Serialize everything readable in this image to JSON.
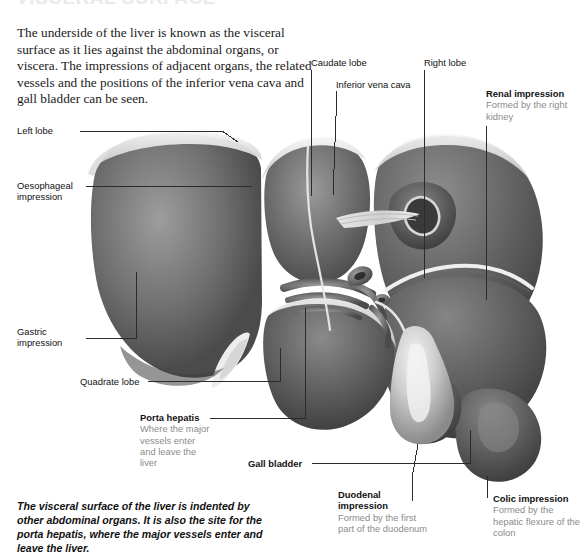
{
  "heading": {
    "clipped_title": "VISCERAL SURFACE"
  },
  "intro": {
    "text": "The underside of the liver is known as the visceral surface as it lies against the abdominal organs, or viscera. The impressions of adjacent organs, the related vessels and the positions of the inferior vena cava and gall bladder can be seen."
  },
  "caption": {
    "text": "The visceral surface of the liver is indented by other abdominal organs. It is also the site for the porta hepatis, where the major vessels enter and leave the liver."
  },
  "labels": {
    "left_lobe": {
      "title": "Left lobe"
    },
    "oesophageal_impression": {
      "line1": "Oesophageal",
      "line2": "impression"
    },
    "gastric_impression": {
      "line1": "Gastric",
      "line2": "impression"
    },
    "quadrate_lobe": {
      "title": "Quadrate lobe"
    },
    "porta_hepatis": {
      "title": "Porta hepatis",
      "sub": "Where the major vessels enter and leave the liver"
    },
    "gall_bladder": {
      "title": "Gall bladder"
    },
    "caudate_lobe": {
      "title": "Caudate lobe"
    },
    "inferior_vena_cava": {
      "title": "Inferior vena cava"
    },
    "right_lobe": {
      "title": "Right lobe"
    },
    "renal_impression": {
      "title": "Renal impression",
      "sub": "Formed by the right kidney"
    },
    "duodenal_impression": {
      "line1": "Duodenal",
      "line2": "impression",
      "sub": "Formed by the first part of the duodenum"
    },
    "colic_impression": {
      "title": "Colic impression",
      "sub": "Formed by the hepatic flexure of the colon"
    }
  },
  "colors": {
    "background": "#ffffff",
    "text": "#111111",
    "subtext": "#8b8b8b",
    "leader": "#2b2b2b",
    "liver_dark": "#4f4f4f",
    "liver_mid": "#6f6f6f",
    "liver_light": "#9a9a9a",
    "ridge": "#ededed",
    "gallbladder": "#d8d8d8"
  }
}
